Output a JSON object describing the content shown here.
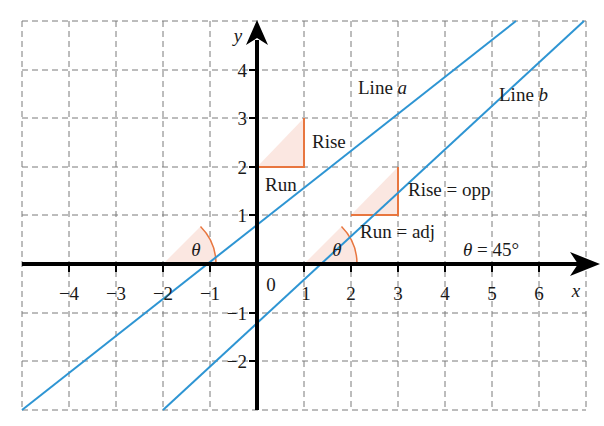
{
  "figure": {
    "grid": {
      "x_min": -5,
      "x_max": 7,
      "y_min": -3,
      "y_max": 5,
      "style": "dashed",
      "color": "#7a7a7a"
    },
    "axes": {
      "x_label": "x",
      "y_label": "y",
      "origin_label": "0",
      "x_ticks": [
        "−4",
        "−3",
        "−2",
        "−1",
        "1",
        "2",
        "3",
        "4",
        "5",
        "6"
      ],
      "y_ticks": [
        "4",
        "3",
        "2",
        "1",
        "−1",
        "−2"
      ]
    },
    "lines": [
      {
        "name": "Line a",
        "label_text": "Line ",
        "label_var": "a",
        "equation": "y = x + 2",
        "color": "#2e95d3"
      },
      {
        "name": "Line b",
        "label_text": "Line ",
        "label_var": "b",
        "equation": "y = x − 1",
        "color": "#2e95d3"
      }
    ],
    "annotations": {
      "triangle_a": {
        "rise": "Rise",
        "run": "Run"
      },
      "triangle_b": {
        "rise": "Rise = opp",
        "run": "Run = adj"
      },
      "angle_a": "θ",
      "angle_b": "θ",
      "angle_value": "θ = 45°"
    },
    "colors": {
      "line": "#2e95d3",
      "triangle": "#e8763f",
      "triangle_fill": "#fbe7e1",
      "axis": "#000000"
    }
  }
}
